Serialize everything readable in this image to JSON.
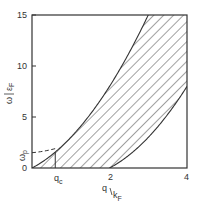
{
  "chart_data": {
    "type": "area",
    "title": "",
    "xlabel": "q / k_F",
    "ylabel": "ω / ε_F",
    "xlim": [
      0,
      4
    ],
    "ylim": [
      0,
      15
    ],
    "x_ticks": [
      {
        "value": 2,
        "label": "2"
      },
      {
        "value": 4,
        "label": "4"
      }
    ],
    "x_special_ticks": [
      {
        "value": 0.6,
        "label": "q_c"
      }
    ],
    "y_ticks": [
      {
        "value": 0,
        "label": "0"
      },
      {
        "value": 5,
        "label": "5"
      },
      {
        "value": 10,
        "label": "10"
      },
      {
        "value": 15,
        "label": "15"
      }
    ],
    "y_special_ticks": [
      {
        "value": 1.5,
        "label": "ω_p"
      }
    ],
    "grid": false,
    "legend": null,
    "series": [
      {
        "name": "upper continuum boundary",
        "formula": "ω/ε_F = (q/k_F)^2 + 2(q/k_F)",
        "x": [
          0,
          0.5,
          1,
          1.5,
          2,
          2.5,
          3
        ],
        "y": [
          0,
          1.25,
          3,
          5.25,
          8,
          11.25,
          15
        ],
        "style": "solid"
      },
      {
        "name": "lower continuum boundary",
        "formula": "ω/ε_F = (q/k_F)^2 - 2(q/k_F), q/k_F > 2",
        "x": [
          2,
          2.5,
          3,
          3.5,
          4
        ],
        "y": [
          0,
          1.25,
          3,
          5.25,
          8
        ],
        "style": "solid"
      },
      {
        "name": "plasmon dispersion",
        "x": [
          0,
          0.3,
          0.6
        ],
        "y": [
          1.5,
          1.6,
          1.9
        ],
        "style": "dashed"
      }
    ],
    "shaded_region": {
      "name": "particle-hole continuum",
      "fill": "diagonal hatching",
      "between": [
        "upper continuum boundary",
        "lower continuum boundary / q-axis"
      ]
    }
  },
  "labels": {
    "y0": "0",
    "y5": "5",
    "y10": "10",
    "y15": "15",
    "x2": "2",
    "x4": "4",
    "wp_main": "ω",
    "wp_sub": "p",
    "qc_main": "q",
    "qc_sub": "c",
    "ylabel_num": "ω",
    "ylabel_den": "ε",
    "ylabel_den_sub": "F",
    "xlabel_num": "q",
    "xlabel_den": "k",
    "xlabel_den_sub": "F"
  },
  "colors": {
    "line": "#333333",
    "hatch": "#444444",
    "background": "#ffffff"
  }
}
